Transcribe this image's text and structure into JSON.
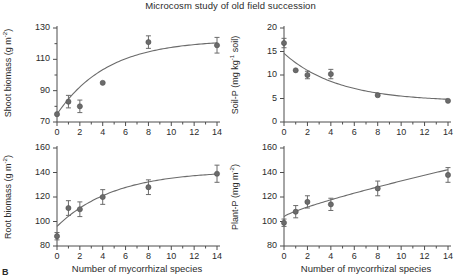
{
  "figure": {
    "title": "Microcosm study of old field succession",
    "panel_letter": "B",
    "marker_color": "#6b6b6b",
    "line_color": "#6b6b6b",
    "axis_color": "#4d4d4d",
    "xlabel": "Number of mycorrhizal species"
  },
  "chart_data": [
    {
      "type": "scatter",
      "id": "shoot-biomass",
      "position": "top-left",
      "title": "",
      "xlabel": "",
      "ylabel": "Shoot biomass (g m-2)",
      "ylabel_base": "Shoot biomass (g m",
      "ylabel_sup": "-2",
      "ylabel_tail": ")",
      "x": [
        0,
        1,
        2,
        4,
        8,
        14
      ],
      "values": [
        75,
        83,
        80,
        95,
        121,
        119
      ],
      "errors": [
        0,
        4,
        4,
        0,
        4,
        5
      ],
      "xlim": [
        0,
        14
      ],
      "ylim": [
        70,
        130
      ],
      "xticks": [
        0,
        1,
        2,
        3,
        4,
        5,
        6,
        7,
        8,
        9,
        10,
        11,
        12,
        13,
        14
      ],
      "xticklabels": [
        "0",
        "",
        "2",
        "",
        "4",
        "",
        "6",
        "",
        "8",
        "",
        "10",
        "",
        "12",
        "",
        "14"
      ],
      "yticks": [
        70,
        80,
        90,
        100,
        110,
        120,
        130
      ],
      "yticklabels": [
        "70",
        "",
        "90",
        "",
        "110",
        "",
        "130"
      ],
      "grid": false,
      "legend": "none",
      "fit": "saturating curve rising from 75 to plateau near 122"
    },
    {
      "type": "scatter",
      "id": "soil-p",
      "position": "top-right",
      "title": "",
      "xlabel": "",
      "ylabel": "Soil-P (mg kg-1 soil)",
      "ylabel_base": "Soil-P (mg kg",
      "ylabel_sup": "-1",
      "ylabel_tail": " soil)",
      "x": [
        0,
        1,
        2,
        4,
        8,
        14
      ],
      "values": [
        16.8,
        11.0,
        10.0,
        10.2,
        5.7,
        4.5
      ],
      "errors": [
        1.0,
        0,
        0.8,
        1.0,
        0,
        0
      ],
      "xlim": [
        0,
        14
      ],
      "ylim": [
        0,
        20
      ],
      "xticks": [
        0,
        1,
        2,
        3,
        4,
        5,
        6,
        7,
        8,
        9,
        10,
        11,
        12,
        13,
        14
      ],
      "xticklabels": [
        "0",
        "",
        "2",
        "",
        "4",
        "",
        "6",
        "",
        "8",
        "",
        "10",
        "",
        "12",
        "",
        "14"
      ],
      "yticks": [
        0,
        5,
        10,
        15,
        20
      ],
      "yticklabels": [
        "0",
        "5",
        "10",
        "15",
        "20"
      ],
      "grid": false,
      "legend": "none",
      "fit": "exponential decay from 14.6 to asymptote near 4.4"
    },
    {
      "type": "scatter",
      "id": "root-biomass",
      "position": "bottom-left",
      "title": "",
      "xlabel": "Number of mycorrhizal species",
      "ylabel": "Root biomass (g m-2)",
      "ylabel_base": "Root biomass (g m",
      "ylabel_sup": "-2",
      "ylabel_tail": ")",
      "x": [
        0,
        1,
        2,
        4,
        8,
        14
      ],
      "values": [
        88,
        111,
        110,
        120,
        128,
        139
      ],
      "errors": [
        3,
        6,
        6,
        6,
        6,
        7
      ],
      "xlim": [
        0,
        14
      ],
      "ylim": [
        80,
        160
      ],
      "xticks": [
        0,
        1,
        2,
        3,
        4,
        5,
        6,
        7,
        8,
        9,
        10,
        11,
        12,
        13,
        14
      ],
      "xticklabels": [
        "0",
        "",
        "2",
        "",
        "4",
        "",
        "6",
        "",
        "8",
        "",
        "10",
        "",
        "12",
        "",
        "14"
      ],
      "yticks": [
        80,
        100,
        120,
        140,
        160
      ],
      "yticklabels": [
        "80",
        "100",
        "120",
        "140",
        "160"
      ],
      "grid": false,
      "legend": "none",
      "fit": "saturating curve rising from 96 to plateau near 140"
    },
    {
      "type": "scatter",
      "id": "plant-p",
      "position": "bottom-right",
      "title": "",
      "xlabel": "Number of mycorrhizal species",
      "ylabel": "Plant-P (mg m-2)",
      "ylabel_base": "Plant-P (mg m",
      "ylabel_sup": "-2",
      "ylabel_tail": ")",
      "x": [
        0,
        1,
        2,
        4,
        8,
        14
      ],
      "values": [
        99,
        108,
        116,
        114,
        127,
        138
      ],
      "errors": [
        3,
        5,
        5,
        5,
        6,
        6
      ],
      "xlim": [
        0,
        14
      ],
      "ylim": [
        80,
        160
      ],
      "xticks": [
        0,
        1,
        2,
        3,
        4,
        5,
        6,
        7,
        8,
        9,
        10,
        11,
        12,
        13,
        14
      ],
      "xticklabels": [
        "0",
        "",
        "2",
        "",
        "4",
        "",
        "6",
        "",
        "8",
        "",
        "10",
        "",
        "12",
        "",
        "14"
      ],
      "yticks": [
        80,
        100,
        120,
        140,
        160
      ],
      "yticklabels": [
        "80",
        "100",
        "120",
        "140",
        "160"
      ],
      "grid": false,
      "legend": "none",
      "fit": "gently rising curve from 104 to 139"
    }
  ]
}
